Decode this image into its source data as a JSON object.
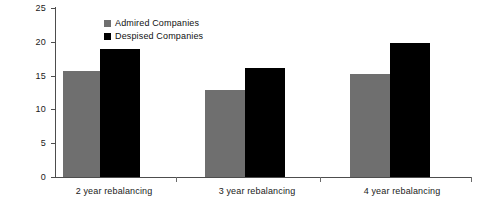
{
  "chart_data": {
    "type": "bar",
    "title": "",
    "subtitle": "",
    "xlabel": "",
    "ylabel": "",
    "categories": [
      "2 year rebalancing",
      "3 year rebalancing",
      "4 year rebalancing"
    ],
    "series": [
      {
        "name": "Admired Companies",
        "color": "#6f6f6f",
        "values": [
          15.7,
          12.9,
          15.2
        ]
      },
      {
        "name": "Despised Companies",
        "color": "#000000",
        "values": [
          19.0,
          16.1,
          19.8
        ]
      }
    ],
    "ylim": [
      0,
      25
    ],
    "yticks": [
      0,
      5,
      10,
      15,
      20,
      25
    ],
    "ytick_labels": [
      "0",
      "5",
      "10",
      "15",
      "20",
      "25"
    ],
    "grid": false,
    "legend_position": "top-center-left",
    "axis_color": "#4d4d4d",
    "background": "#ffffff"
  },
  "legend": {
    "items": [
      {
        "label": "Admired Companies",
        "swatch": "gray"
      },
      {
        "label": "Despised Companies",
        "swatch": "black"
      }
    ]
  }
}
